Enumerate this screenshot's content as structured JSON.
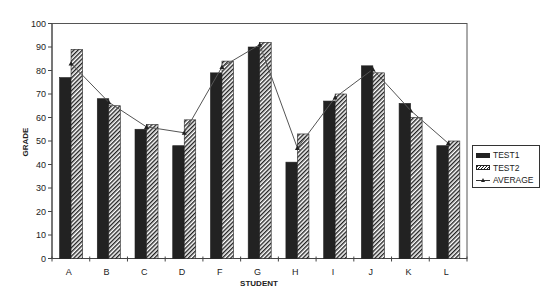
{
  "chart_data": {
    "type": "bar",
    "title": "",
    "xlabel": "STUDENT",
    "ylabel": "GRADE",
    "ylim": [
      0,
      100
    ],
    "yticks": [
      0,
      10,
      20,
      30,
      40,
      50,
      60,
      70,
      80,
      90,
      100
    ],
    "categories": [
      "A",
      "B",
      "C",
      "D",
      "F",
      "G",
      "H",
      "I",
      "J",
      "K",
      "L"
    ],
    "series": [
      {
        "name": "TEST1",
        "kind": "bar",
        "style": "solid",
        "values": [
          77,
          68,
          55,
          48,
          79,
          90,
          41,
          67,
          82,
          66,
          48
        ]
      },
      {
        "name": "TEST2",
        "kind": "bar",
        "style": "hatched",
        "values": [
          89,
          65,
          57,
          59,
          84,
          92,
          53,
          70,
          79,
          60,
          50
        ]
      },
      {
        "name": "AVERAGE",
        "kind": "line",
        "marker": "triangle",
        "values": [
          83,
          66.5,
          56,
          53.5,
          81.5,
          91,
          47,
          68.5,
          80.5,
          63,
          49
        ]
      }
    ],
    "grid": false,
    "legend_position": "right"
  },
  "legend": {
    "items": [
      {
        "label": "TEST1"
      },
      {
        "label": "TEST2"
      },
      {
        "label": "AVERAGE"
      }
    ]
  }
}
